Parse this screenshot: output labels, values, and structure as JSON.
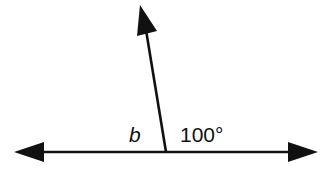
{
  "diagram": {
    "type": "angles-on-a-line",
    "labels": {
      "angle_b": "b",
      "angle_known": "100°"
    },
    "colors": {
      "stroke": "#111111",
      "background": "#ffffff"
    }
  }
}
